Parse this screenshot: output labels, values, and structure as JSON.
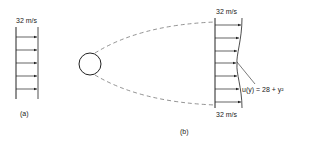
{
  "figure": {
    "panel_a": {
      "caption": "(a)",
      "velocity_label": "32 m/s"
    },
    "panel_b": {
      "caption": "(b)",
      "top_velocity_label": "32 m/s",
      "bottom_velocity_label": "32 m/s",
      "profile_equation": "u(y) = 28 + y²"
    },
    "colors": {
      "line": "#222222",
      "dashed": "#777777",
      "background": "#ffffff"
    }
  }
}
